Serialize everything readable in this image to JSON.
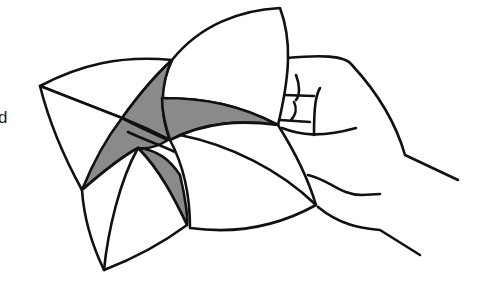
{
  "figure": {
    "caption_fragment": "d",
    "colors": {
      "line": "#111111",
      "shade": "#8a8a8a",
      "background": "#ffffff"
    }
  }
}
